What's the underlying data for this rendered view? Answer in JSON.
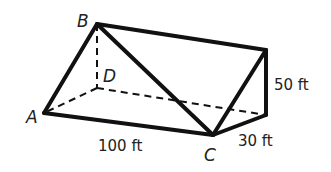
{
  "figure": {
    "vertices": {
      "A": {
        "label": "A",
        "x": 44,
        "y": 113
      },
      "B": {
        "label": "B",
        "x": 97,
        "y": 24
      },
      "C": {
        "label": "C",
        "x": 213,
        "y": 135
      },
      "D": {
        "label": "D",
        "x": 97,
        "y": 88
      },
      "E": {
        "label": "",
        "x": 266,
        "y": 50
      },
      "F": {
        "label": "",
        "x": 266,
        "y": 115
      }
    },
    "labels": {
      "A": "A",
      "B": "B",
      "C": "C",
      "D": "D"
    },
    "dimensions": {
      "length": "100 ft",
      "width": "30 ft",
      "height": "50 ft"
    },
    "colors": {
      "stroke": "#111111",
      "text": "#222222",
      "background": "#ffffff"
    }
  }
}
